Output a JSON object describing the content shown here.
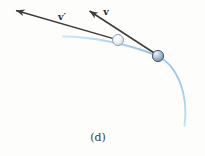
{
  "figure": {
    "caption": "(d)",
    "vector_v_prime_label": "v′",
    "vector_v_label": "v",
    "colors": {
      "arrow": "#3b3b3b",
      "arrowhead": "#3b3b3b",
      "path_blue": "#9cc8e8",
      "ball_light_fill": "#eef2f6",
      "ball_light_stroke": "#8e9aa7",
      "ball_dark_fill": "#8aa3bd",
      "ball_dark_stroke": "#46597b",
      "label_text": "#2c2c2c",
      "caption_text": "#3f3f3f"
    }
  }
}
